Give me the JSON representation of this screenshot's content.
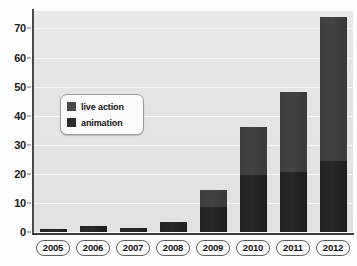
{
  "chart_data": {
    "type": "bar",
    "subtype": "stacked-bar",
    "title": "",
    "xlabel": "",
    "ylabel": "",
    "ylim": [
      0,
      76
    ],
    "yticks": [
      0,
      10,
      20,
      30,
      40,
      50,
      60,
      70
    ],
    "ytick_labels": [
      "0",
      "10",
      "20",
      "30",
      "40",
      "50",
      "60",
      "70"
    ],
    "grid": true,
    "grid_axis": "y",
    "legend_position": "inside-upper-left",
    "categories": [
      "2005",
      "2006",
      "2007",
      "2008",
      "2009",
      "2010",
      "2011",
      "2012"
    ],
    "series": [
      {
        "name": "live action",
        "color": "#262626",
        "values": [
          1,
          2,
          1.5,
          3.5,
          8.5,
          19.5,
          20.5,
          24.5
        ]
      },
      {
        "name": "animation",
        "color": "#404040",
        "values": [
          0,
          0,
          0,
          0,
          6,
          16.5,
          27.5,
          49.5
        ]
      }
    ],
    "totals": [
      1,
      2,
      1.5,
      3.5,
      14.5,
      36,
      48,
      74
    ]
  },
  "legend": {
    "items": [
      {
        "label": "live action",
        "swatch_class": "live"
      },
      {
        "label": "animation",
        "swatch_class": "anim"
      }
    ]
  },
  "colors": {
    "plot_background": "#e5e5e5",
    "gridline": "#f5f5f5",
    "axis": "#3b3b3b",
    "live_action": "#262626",
    "animation": "#404040",
    "page_background": "#fdfdfd"
  }
}
